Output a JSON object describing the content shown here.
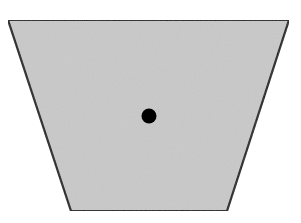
{
  "diagram": {
    "width": 301,
    "height": 223,
    "background": "#ffffff",
    "shape": {
      "type": "trapezoid",
      "points": [
        [
          8,
          20
        ],
        [
          289,
          20
        ],
        [
          227,
          211
        ],
        [
          71,
          211
        ]
      ],
      "fill": "#c9c9c9",
      "stroke": "#1e1e1e",
      "stroke_width": 2.2
    },
    "point": {
      "type": "dot",
      "cx": 149,
      "cy": 116,
      "r": 7.5,
      "fill": "#000000"
    }
  }
}
